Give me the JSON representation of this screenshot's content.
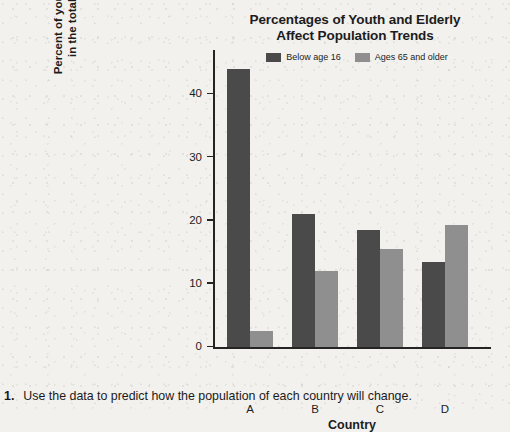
{
  "chart_data": {
    "type": "bar",
    "title": "Percentages of Youth and Elderly Affect Population Trends",
    "title_line1": "Percentages of Youth and Elderly",
    "title_line2": "Affect Population Trends",
    "xlabel": "Country",
    "ylabel": "Percent of youth and elderly in the total population",
    "ylabel_line1": "Percent of youth and elderly",
    "ylabel_line2": "in the total population",
    "categories": [
      "A",
      "B",
      "C",
      "D"
    ],
    "yticks": [
      0,
      10,
      20,
      30,
      40
    ],
    "ylim": [
      0,
      47
    ],
    "grid": false,
    "legend_position": "top",
    "series": [
      {
        "name": "Below age 16",
        "color": "#4a4a4a",
        "values": [
          44,
          21,
          18.5,
          13.5
        ]
      },
      {
        "name": "Ages 65 and older",
        "color": "#8f8f8f",
        "values": [
          2.5,
          12,
          15.5,
          19.3
        ]
      }
    ]
  },
  "question": {
    "number": "1.",
    "text": "Use the data to predict how the population of each country will change."
  }
}
